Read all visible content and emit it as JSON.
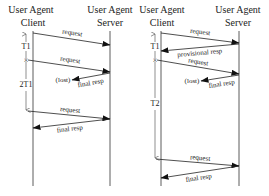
{
  "diagrams": [
    {
      "id": "left",
      "client_title": [
        "User Agent",
        "Client"
      ],
      "server_title": [
        "User Agent",
        "Server"
      ],
      "timers": [
        {
          "label": "T1"
        },
        {
          "label": "2T1"
        }
      ],
      "messages": [
        {
          "label": "request",
          "direction": "client-to-server",
          "lost": false
        },
        {
          "label": "request",
          "direction": "client-to-server",
          "lost": false,
          "retransmission": true
        },
        {
          "label": "final resp",
          "direction": "server-to-client",
          "lost": true,
          "lost_label": "(lost)"
        },
        {
          "label": "request",
          "direction": "client-to-server",
          "lost": false
        },
        {
          "label": "final resp",
          "direction": "server-to-client",
          "lost": false
        }
      ]
    },
    {
      "id": "right",
      "client_title": [
        "User Agent",
        "Client"
      ],
      "server_title": [
        "User Agent",
        "Server"
      ],
      "timers": [
        {
          "label": "T1"
        },
        {
          "label": "T2"
        }
      ],
      "messages": [
        {
          "label": "request",
          "direction": "client-to-server",
          "lost": false
        },
        {
          "label": "provisional resp",
          "direction": "server-to-client",
          "lost": false
        },
        {
          "label": "request",
          "direction": "client-to-server",
          "lost": false,
          "retransmission": true
        },
        {
          "label": "final resp",
          "direction": "server-to-client",
          "lost": true,
          "lost_label": "(lost)"
        },
        {
          "label": "request",
          "direction": "client-to-server",
          "lost": false
        },
        {
          "label": "final resp",
          "direction": "server-to-client",
          "lost": false
        }
      ]
    }
  ]
}
